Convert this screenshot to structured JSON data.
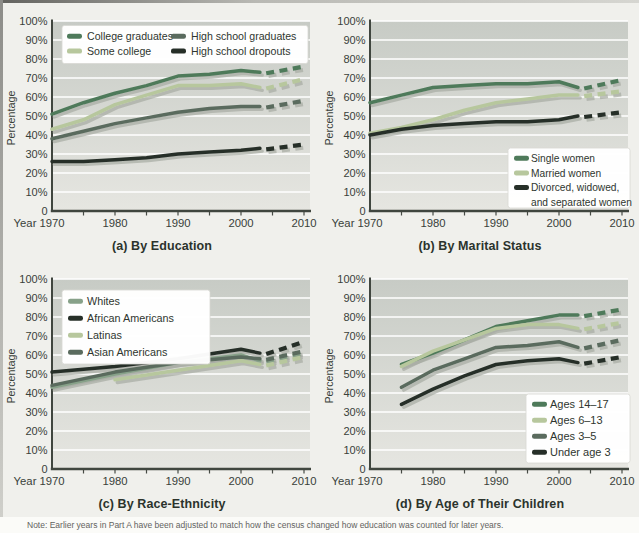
{
  "colors": {
    "dark_green": "#4e7a5a",
    "light_green": "#b7c79d",
    "medium_green": "#87a189",
    "gray_green": "#5a6b5e",
    "black_green": "#262f28",
    "plot_bg_top": "#c7cbc5",
    "plot_bg_bottom": "#e6e6e1",
    "gridline": "#ffffff",
    "axis": "#40463f",
    "tick_text": "#39413a",
    "caption_text": "#2b332c",
    "figure_bg": "#f0f0ec",
    "legend_bg": "#ffffff",
    "shadow": "#a7aba3"
  },
  "axes": {
    "ylabel": "Percentage",
    "xlabel": "Year",
    "y_tick_labels": [
      "0",
      "10%",
      "20%",
      "30%",
      "40%",
      "50%",
      "60%",
      "70%",
      "80%",
      "90%",
      "100%"
    ],
    "x_tick_labels": [
      "1970",
      "1980",
      "1990",
      "2000",
      "2010"
    ],
    "x_tick_years": [
      1970,
      1980,
      1990,
      2000,
      2010
    ],
    "minor_x_ticks": [
      1975,
      1980,
      1985,
      1990,
      1995,
      2000,
      2005,
      2010
    ],
    "ylim": [
      0,
      100
    ],
    "xlim": [
      1970,
      2010
    ]
  },
  "chart_data": [
    {
      "id": "a",
      "type": "line",
      "caption": "(a) By Education",
      "xlabel": "Year",
      "ylabel": "Percentage",
      "ylim": [
        0,
        100
      ],
      "xlim": [
        1970,
        2010
      ],
      "legend_position": "top",
      "legend_font": 10.6,
      "series": [
        {
          "name": "College graduates",
          "color": "#4e7a5a",
          "years": [
            1970,
            1975,
            1980,
            1985,
            1990,
            1995,
            2000,
            2003
          ],
          "values": [
            51,
            57,
            62,
            66,
            71,
            72,
            74,
            73
          ],
          "proj_years": [
            2004,
            2010
          ],
          "proj_values": [
            72.5,
            76
          ]
        },
        {
          "name": "Some college",
          "color": "#b7c79d",
          "years": [
            1970,
            1975,
            1980,
            1985,
            1990,
            1995,
            2000,
            2003
          ],
          "values": [
            43,
            48,
            56,
            61,
            66,
            66,
            67,
            65
          ],
          "proj_years": [
            2004,
            2010
          ],
          "proj_values": [
            64.5,
            69.5
          ]
        },
        {
          "name": "High school graduates",
          "color": "#5a6b5e",
          "years": [
            1970,
            1975,
            1980,
            1985,
            1990,
            1995,
            2000,
            2003
          ],
          "values": [
            38,
            42,
            46,
            49,
            52,
            54,
            55,
            55
          ],
          "proj_years": [
            2004,
            2010
          ],
          "proj_values": [
            54.5,
            58
          ]
        },
        {
          "name": "High school dropouts",
          "color": "#262f28",
          "years": [
            1970,
            1975,
            1980,
            1985,
            1990,
            1995,
            2000,
            2003
          ],
          "values": [
            26,
            26,
            27,
            28,
            30,
            31,
            32,
            33
          ],
          "proj_years": [
            2004,
            2010
          ],
          "proj_values": [
            32.5,
            35
          ]
        }
      ]
    },
    {
      "id": "b",
      "type": "line",
      "caption": "(b) By Marital Status",
      "xlabel": "Year",
      "ylabel": "Percentage",
      "ylim": [
        0,
        100
      ],
      "xlim": [
        1970,
        2010
      ],
      "legend_position": "bottom-right",
      "legend_font": 10.2,
      "series": [
        {
          "name": "Single women",
          "color": "#4e7a5a",
          "years": [
            1970,
            1975,
            1980,
            1985,
            1990,
            1995,
            2000,
            2003
          ],
          "values": [
            57,
            61,
            65,
            66,
            67,
            67,
            68,
            65
          ],
          "proj_years": [
            2004,
            2010
          ],
          "proj_values": [
            64.5,
            69
          ]
        },
        {
          "name": "Married women",
          "color": "#b7c79d",
          "years": [
            1970,
            1975,
            1980,
            1985,
            1990,
            1995,
            2000,
            2003
          ],
          "values": [
            41,
            44,
            48,
            53,
            57,
            59,
            61,
            61
          ],
          "proj_years": [
            2004,
            2010
          ],
          "proj_values": [
            60.5,
            63
          ]
        },
        {
          "name": "Divorced, widowed, and separated women",
          "legend_lines": [
            "Divorced, widowed,",
            "and separated women"
          ],
          "color": "#262f28",
          "years": [
            1970,
            1975,
            1980,
            1985,
            1990,
            1995,
            2000,
            2003
          ],
          "values": [
            40,
            43,
            45,
            46,
            47,
            47,
            48,
            50
          ],
          "proj_years": [
            2004,
            2010
          ],
          "proj_values": [
            49.5,
            52
          ]
        }
      ]
    },
    {
      "id": "c",
      "type": "line",
      "caption": "(c) By Race-Ethnicity",
      "xlabel": "Year",
      "ylabel": "Percentage",
      "ylim": [
        0,
        100
      ],
      "xlim": [
        1970,
        2010
      ],
      "legend_position": "top-left",
      "legend_font": 10.8,
      "series": [
        {
          "name": "Whites",
          "color": "#87a189",
          "years": [
            1970,
            1980,
            1990,
            2000,
            2003
          ],
          "values": [
            43,
            50,
            56,
            60,
            57
          ],
          "proj_years": [
            2004,
            2010
          ],
          "proj_values": [
            56.5,
            61
          ]
        },
        {
          "name": "African Americans",
          "color": "#262f28",
          "years": [
            1970,
            1980,
            1990,
            2000,
            2003
          ],
          "values": [
            51,
            54,
            58,
            63,
            61
          ],
          "proj_years": [
            2004,
            2010
          ],
          "proj_values": [
            60.5,
            67
          ]
        },
        {
          "name": "Latinas",
          "color": "#b7c79d",
          "years": [
            1980,
            1990,
            2000,
            2003
          ],
          "values": [
            47,
            52,
            57,
            55
          ],
          "proj_years": [
            2004,
            2010
          ],
          "proj_values": [
            54.5,
            59
          ]
        },
        {
          "name": "Asian Americans",
          "color": "#5a6b5e",
          "years": [
            1970,
            1980,
            1990,
            2000,
            2003
          ],
          "values": [
            44,
            51,
            56,
            59,
            58
          ],
          "proj_years": [
            2004,
            2010
          ],
          "proj_values": [
            57.5,
            62
          ]
        }
      ]
    },
    {
      "id": "d",
      "type": "line",
      "caption": "(d) By Age of Their Children",
      "xlabel": "Year",
      "ylabel": "Percentage",
      "ylim": [
        0,
        100
      ],
      "xlim": [
        1970,
        2010
      ],
      "legend_position": "bottom-right",
      "legend_font": 11,
      "series": [
        {
          "name": "Ages 14–17",
          "color": "#4e7a5a",
          "years": [
            1975,
            1980,
            1985,
            1990,
            1995,
            2000,
            2003
          ],
          "values": [
            55,
            61,
            68,
            75,
            78,
            81,
            81
          ],
          "proj_years": [
            2004,
            2010
          ],
          "proj_values": [
            80.5,
            84
          ]
        },
        {
          "name": "Ages 6–13",
          "color": "#b7c79d",
          "years": [
            1975,
            1980,
            1985,
            1990,
            1995,
            2000,
            2003
          ],
          "values": [
            54,
            62,
            68,
            74,
            76,
            76,
            74
          ],
          "proj_years": [
            2004,
            2010
          ],
          "proj_values": [
            73.5,
            77
          ]
        },
        {
          "name": "Ages 3–5",
          "color": "#5a6b5e",
          "years": [
            1975,
            1980,
            1985,
            1990,
            1995,
            2000,
            2003
          ],
          "values": [
            43,
            52,
            58,
            64,
            65,
            67,
            64
          ],
          "proj_years": [
            2004,
            2010
          ],
          "proj_values": [
            63.5,
            68
          ]
        },
        {
          "name": "Under age 3",
          "color": "#262f28",
          "years": [
            1975,
            1980,
            1985,
            1990,
            1995,
            2000,
            2003
          ],
          "values": [
            34,
            42,
            49,
            55,
            57,
            58,
            56
          ],
          "proj_years": [
            2004,
            2010
          ],
          "proj_values": [
            55.5,
            59
          ]
        }
      ]
    }
  ],
  "note": "Note: Earlier years in Part A have been adjusted to match how the census changed how education was counted for later years."
}
